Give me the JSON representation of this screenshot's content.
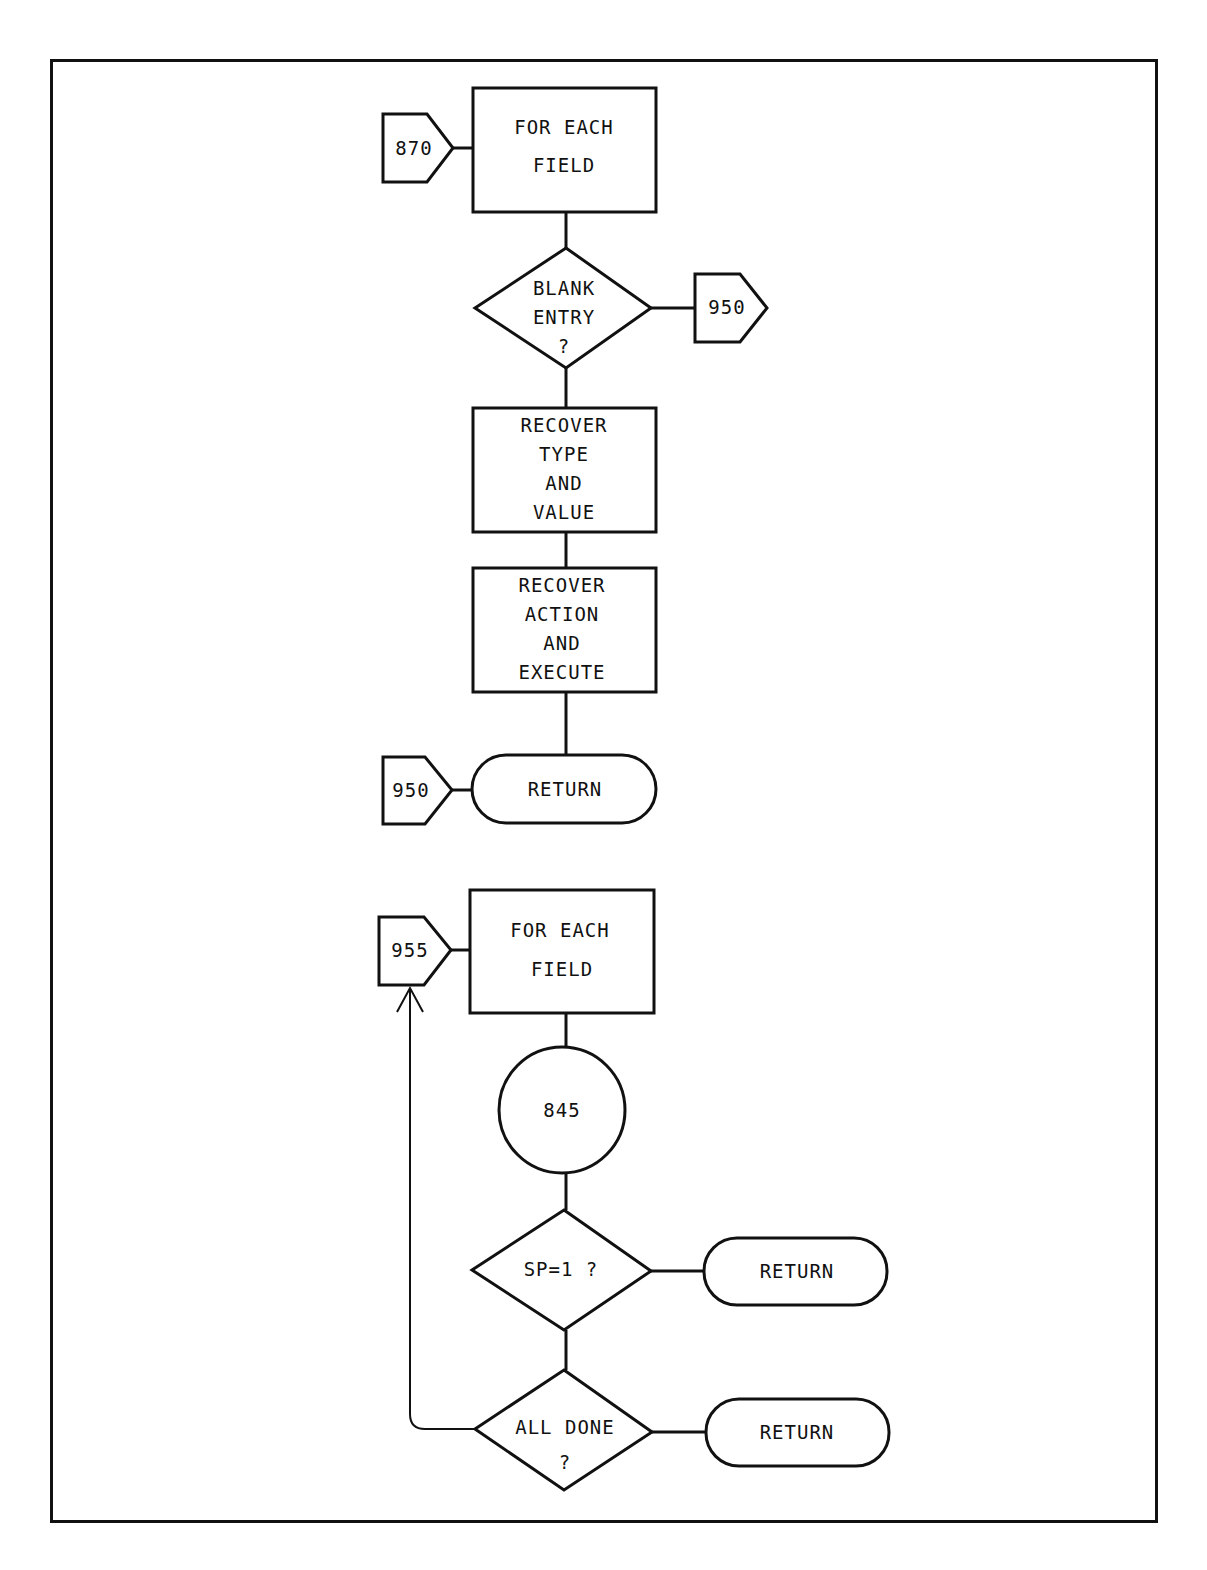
{
  "colors": {
    "line": "#111111",
    "background": "#ffffff"
  },
  "flowchart_top": {
    "entry_connector": "870",
    "loop_box": [
      "FOR EACH",
      "FIELD"
    ],
    "decision": [
      "BLANK",
      "ENTRY",
      "?"
    ],
    "decision_connector": "950",
    "step1": [
      "RECOVER",
      "TYPE",
      "AND",
      "VALUE"
    ],
    "step2": [
      "RECOVER",
      "ACTION",
      "AND",
      "EXECUTE"
    ],
    "end_connector": "950",
    "terminator": "RETURN"
  },
  "flowchart_bottom": {
    "entry_connector": "955",
    "loop_box": [
      "FOR EACH",
      "FIELD"
    ],
    "subroutine": "845",
    "decision1": [
      "SP=1 ?"
    ],
    "decision1_terminator": "RETURN",
    "decision2": [
      "ALL DONE",
      "?"
    ],
    "decision2_terminator": "RETURN"
  }
}
